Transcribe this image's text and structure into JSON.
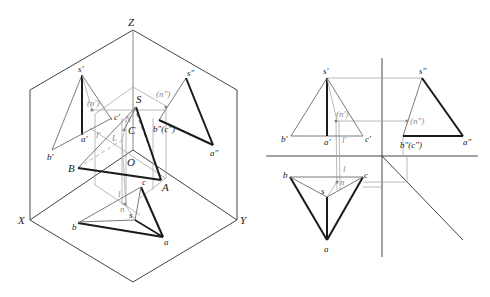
{
  "colors": {
    "frame": "#444444",
    "thick": "#1a1a1a",
    "thin": "#7a7a7a",
    "construction": "#a8a8a8",
    "label": "#222222",
    "hidden_label": "#8a8a8a"
  },
  "isometric_view": {
    "axes": {
      "z_label": "Z",
      "x_label": "X",
      "y_label": "Y",
      "origin_label": "O"
    },
    "space_points": {
      "S": "S",
      "A": "A",
      "B": "B",
      "C": "C",
      "N": "N",
      "L": "L"
    },
    "front_projection": {
      "s": "s'",
      "a": "a'",
      "b": "b'",
      "c": "c'",
      "n": "(n')",
      "l": "l'"
    },
    "side_projection": {
      "s": "s\"",
      "a": "a\"",
      "bc": "b\"(c\")",
      "n": "(n\")"
    },
    "top_projection": {
      "s": "s",
      "a": "a",
      "b": "b",
      "c": "c",
      "n": "n",
      "l": "l"
    }
  },
  "orthographic_view": {
    "front": {
      "s": "s'",
      "a": "a'",
      "b": "b'",
      "c": "c'",
      "n": "(n')",
      "l": "l'"
    },
    "side": {
      "s": "s\"",
      "a": "a\"",
      "bc": "b\"(c\")",
      "n": "(n\")"
    },
    "top": {
      "s": "s",
      "a": "a",
      "b": "b",
      "c": "c",
      "n": "n",
      "l": "l"
    }
  }
}
